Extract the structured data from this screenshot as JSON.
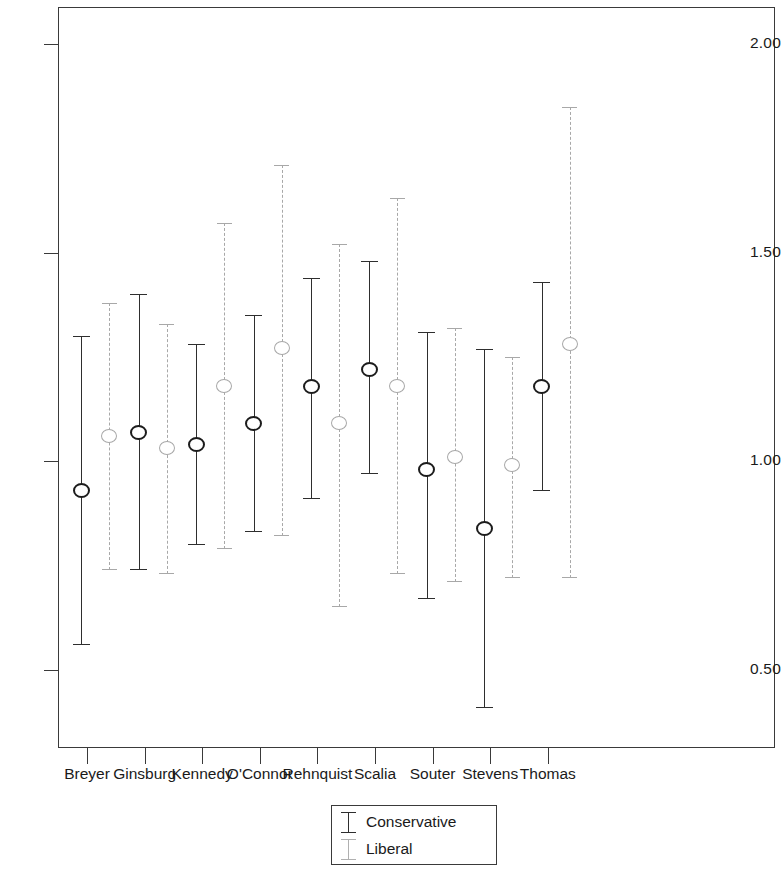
{
  "chart_data": {
    "type": "scatter",
    "title": "",
    "subtitle": "",
    "xlabel": "",
    "ylabel": "",
    "grid": false,
    "legend_position": "bottom-center",
    "ylim": [
      0.37,
      2.09
    ],
    "yticks": [
      2.0,
      1.5,
      1.0,
      0.5
    ],
    "ytick_labels": [
      "2.00",
      "1.50",
      "1.00",
      "0.50"
    ],
    "categories": [
      "Breyer",
      "Ginsburg",
      "Kennedy",
      "O'Connor",
      "Rehnquist",
      "Scalia",
      "Souter",
      "Stevens",
      "Thomas"
    ],
    "series": [
      {
        "name": "Conservative",
        "style": "solid",
        "color": "#2e2e2e",
        "values": [
          0.93,
          1.07,
          1.04,
          1.09,
          1.18,
          1.22,
          0.98,
          0.84,
          1.18
        ],
        "ci_low": [
          0.56,
          0.74,
          0.8,
          0.83,
          0.91,
          0.97,
          0.67,
          0.41,
          0.93
        ],
        "ci_high": [
          1.3,
          1.4,
          1.28,
          1.35,
          1.44,
          1.48,
          1.31,
          1.27,
          1.43
        ]
      },
      {
        "name": "Liberal",
        "style": "dashed",
        "color": "#a8a8a8",
        "values": [
          1.06,
          1.03,
          1.18,
          1.27,
          1.09,
          1.18,
          1.01,
          0.99,
          1.28
        ],
        "ci_low": [
          0.74,
          0.73,
          0.79,
          0.82,
          0.65,
          0.73,
          0.71,
          0.72,
          0.72
        ],
        "ci_high": [
          1.38,
          1.33,
          1.57,
          1.71,
          1.52,
          1.63,
          1.32,
          1.25,
          1.85
        ]
      }
    ]
  },
  "legend": {
    "entries": [
      {
        "label": "Conservative"
      },
      {
        "label": "Liberal"
      }
    ]
  }
}
